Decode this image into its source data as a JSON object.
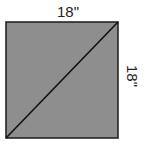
{
  "diagram": {
    "shape": "square",
    "fill_color": "#8c8c8c",
    "stroke_color": "#1a1a1a",
    "diagonal": "bottom-left to top-right",
    "top_label": "18\"",
    "right_label": "18\""
  }
}
